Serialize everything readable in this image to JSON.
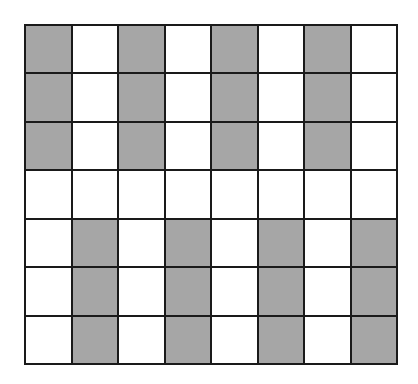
{
  "grid": {
    "rows": 7,
    "columns": 8,
    "colors": {
      "shaded": "#a6a6a6",
      "empty": "#ffffff",
      "line": "#1a1a1a"
    },
    "cells": [
      [
        1,
        0,
        1,
        0,
        1,
        0,
        1,
        0
      ],
      [
        1,
        0,
        1,
        0,
        1,
        0,
        1,
        0
      ],
      [
        1,
        0,
        1,
        0,
        1,
        0,
        1,
        0
      ],
      [
        0,
        0,
        0,
        0,
        0,
        0,
        0,
        0
      ],
      [
        0,
        1,
        0,
        1,
        0,
        1,
        0,
        1
      ],
      [
        0,
        1,
        0,
        1,
        0,
        1,
        0,
        1
      ],
      [
        0,
        1,
        0,
        1,
        0,
        1,
        0,
        1
      ]
    ]
  }
}
